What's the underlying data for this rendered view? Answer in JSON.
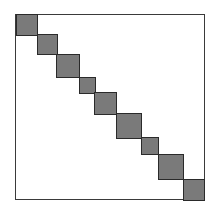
{
  "diagram": {
    "title": "Block-diagonal matrix",
    "type": "block-diagonal",
    "frame": {
      "left": 15,
      "top": 14,
      "right": 204,
      "bottom": 199,
      "stroke": "#3a3a3a"
    },
    "block_fill": "#7a7a7a",
    "block_stroke": "#2a2a2a",
    "blocks": [
      {
        "x": 16,
        "y": 14,
        "size": 21
      },
      {
        "x": 37,
        "y": 34,
        "size": 20
      },
      {
        "x": 56,
        "y": 54,
        "size": 23
      },
      {
        "x": 79,
        "y": 77,
        "size": 16
      },
      {
        "x": 94,
        "y": 92,
        "size": 22
      },
      {
        "x": 116,
        "y": 113,
        "size": 25
      },
      {
        "x": 141,
        "y": 137,
        "size": 17
      },
      {
        "x": 158,
        "y": 154,
        "size": 25
      },
      {
        "x": 183,
        "y": 179,
        "size": 21
      }
    ],
    "block_count": 9
  }
}
